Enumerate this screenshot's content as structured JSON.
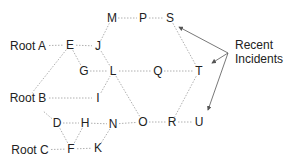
{
  "diagram": {
    "nodes": [
      {
        "id": "RootA",
        "label": "Root A",
        "x": 28,
        "y": 46
      },
      {
        "id": "E",
        "label": "E",
        "x": 70,
        "y": 45
      },
      {
        "id": "J",
        "label": "J",
        "x": 98,
        "y": 46
      },
      {
        "id": "M",
        "label": "M",
        "x": 112,
        "y": 18
      },
      {
        "id": "P",
        "label": "P",
        "x": 143,
        "y": 18
      },
      {
        "id": "S",
        "label": "S",
        "x": 170,
        "y": 18
      },
      {
        "id": "G",
        "label": "G",
        "x": 84,
        "y": 71
      },
      {
        "id": "L",
        "label": "L",
        "x": 113,
        "y": 71
      },
      {
        "id": "Q",
        "label": "Q",
        "x": 158,
        "y": 71
      },
      {
        "id": "T",
        "label": "T",
        "x": 199,
        "y": 71
      },
      {
        "id": "RootB",
        "label": "Root B",
        "x": 28,
        "y": 98
      },
      {
        "id": "I",
        "label": "I",
        "x": 98,
        "y": 98
      },
      {
        "id": "D",
        "label": "D",
        "x": 57,
        "y": 123
      },
      {
        "id": "H",
        "label": "H",
        "x": 85,
        "y": 123
      },
      {
        "id": "N",
        "label": "N",
        "x": 113,
        "y": 124
      },
      {
        "id": "O",
        "label": "O",
        "x": 143,
        "y": 122
      },
      {
        "id": "R",
        "label": "R",
        "x": 172,
        "y": 122
      },
      {
        "id": "U",
        "label": "U",
        "x": 199,
        "y": 122
      },
      {
        "id": "RootC",
        "label": "Root C",
        "x": 30,
        "y": 150
      },
      {
        "id": "F",
        "label": "F",
        "x": 71,
        "y": 149
      },
      {
        "id": "K",
        "label": "K",
        "x": 98,
        "y": 148
      }
    ],
    "edges": [
      [
        "RootA",
        "E"
      ],
      [
        "E",
        "J"
      ],
      [
        "E",
        "G"
      ],
      [
        "E",
        "RootB"
      ],
      [
        "J",
        "M"
      ],
      [
        "M",
        "P"
      ],
      [
        "P",
        "S"
      ],
      [
        "S",
        "T"
      ],
      [
        "G",
        "L"
      ],
      [
        "J",
        "L"
      ],
      [
        "L",
        "Q"
      ],
      [
        "Q",
        "T"
      ],
      [
        "T",
        "R"
      ],
      [
        "L",
        "O"
      ],
      [
        "RootB",
        "I"
      ],
      [
        "I",
        "L"
      ],
      [
        "RootB",
        "D"
      ],
      [
        "D",
        "H"
      ],
      [
        "H",
        "N"
      ],
      [
        "N",
        "O"
      ],
      [
        "O",
        "R"
      ],
      [
        "R",
        "U"
      ],
      [
        "D",
        "F"
      ],
      [
        "H",
        "F"
      ],
      [
        "F",
        "K"
      ],
      [
        "K",
        "N"
      ],
      [
        "RootC",
        "F"
      ]
    ],
    "annotation": {
      "label_line1": "Recent",
      "label_line2": "Incidents",
      "x": 235,
      "y": 44,
      "arrows": [
        {
          "from": [
            228,
            53
          ],
          "to": [
            179,
            27
          ]
        },
        {
          "from": [
            228,
            53
          ],
          "to": [
            212,
            63
          ]
        },
        {
          "from": [
            228,
            53
          ],
          "to": [
            208,
            110
          ]
        }
      ]
    },
    "colors": {
      "edge": "#b0b0b0",
      "arrow": "#555555",
      "text": "#222222"
    }
  }
}
